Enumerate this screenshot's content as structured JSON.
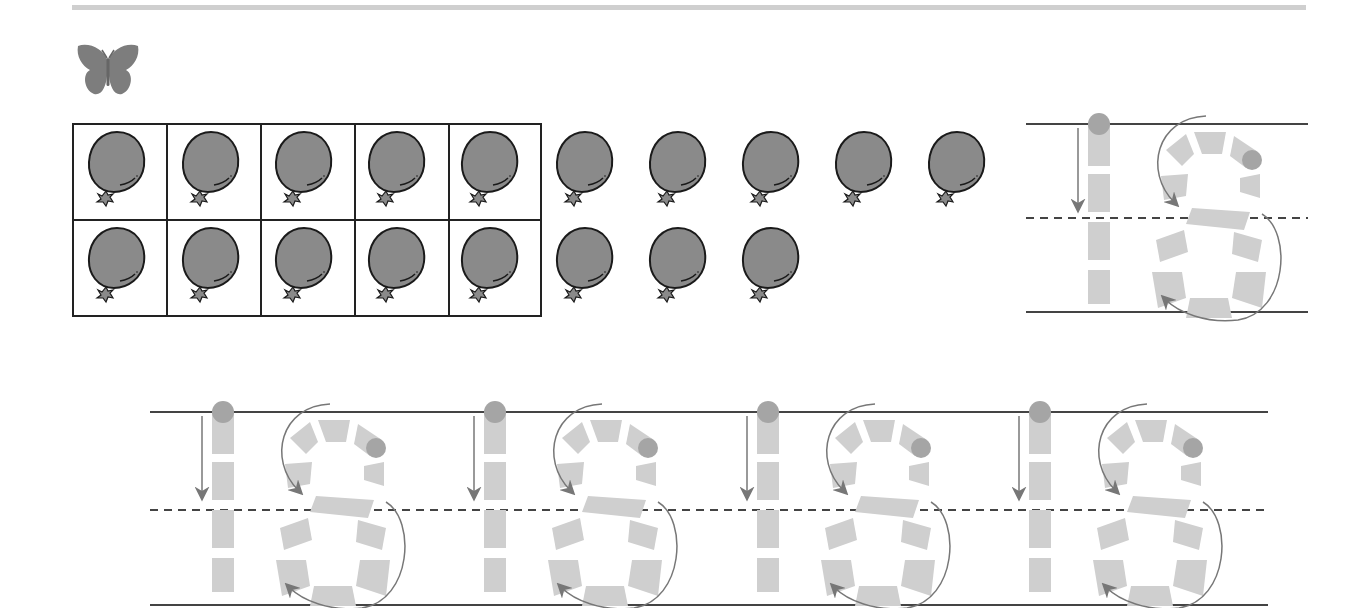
{
  "worksheet": {
    "number": "18",
    "icon": "butterfly-icon",
    "ten_frame": {
      "rows": 2,
      "cols": 5,
      "filled": 10
    },
    "balloons": {
      "total": 18,
      "row1_count": 10,
      "row2_count": 8,
      "color": "#8a8a8a",
      "outline": "#1a1a1a"
    },
    "tracing": {
      "digit": "18",
      "example_count": 1,
      "practice_count": 4,
      "guide_color": "#c8c8c8",
      "start_dot_color": "#9a9a9a",
      "arrow_color": "#777777"
    }
  }
}
